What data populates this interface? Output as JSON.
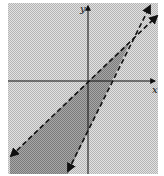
{
  "figure": {
    "type": "system-of-linear-inequalities-graph",
    "axes": {
      "x_label": "x",
      "y_label": "y"
    },
    "boundary_lines": [
      {
        "name": "line-shallow",
        "style": "dashed",
        "passes_through_origin": true,
        "arrows": "both-ends"
      },
      {
        "name": "line-steep",
        "style": "dashed",
        "passes_through_origin": false,
        "arrows": "both-ends"
      }
    ],
    "shaded_region": "wedge between the two dashed lines, below their intersection in quadrant I",
    "colors": {
      "background_pattern": "#c8c8c8",
      "region_fill": "#8f8f8f",
      "line": "#111111",
      "axis": "#111111"
    }
  }
}
